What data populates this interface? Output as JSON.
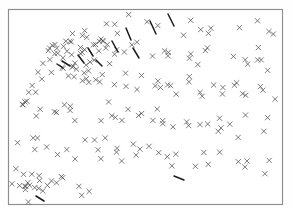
{
  "figure": {
    "title": "",
    "subtitle": "",
    "background_color": "#ffffff",
    "frame_color": "#8d8d8d",
    "marker_color": "#4a4a4a",
    "cluster_color": "#1a1a1a",
    "width_px": 293,
    "height_px": 219
  },
  "frame": {
    "x": 8,
    "y": 9,
    "width": 275,
    "height": 196
  },
  "chart_data": {
    "type": "scatter",
    "title": "",
    "subtitle": "",
    "xlabel": "",
    "ylabel": "",
    "xlim": [
      0,
      1
    ],
    "ylim": [
      0,
      1
    ],
    "grid": false,
    "legend": null,
    "marker": "x",
    "marker_size": 2.6,
    "point_count": 214,
    "annotations": [],
    "x": [
      0.447,
      0.52,
      0.545,
      0.572,
      0.6,
      0.625,
      0.658,
      0.694,
      0.72,
      0.76,
      0.795,
      0.833,
      0.865,
      0.9,
      0.935,
      0.963,
      0.985,
      0.413,
      0.383,
      0.352,
      0.32,
      0.287,
      0.26,
      0.236,
      0.213,
      0.19,
      0.167,
      0.146,
      0.128,
      0.112,
      0.098,
      0.086,
      0.074,
      0.063,
      0.054,
      0.046,
      0.04,
      0.034,
      0.2,
      0.222,
      0.245,
      0.266,
      0.288,
      0.307,
      0.33,
      0.354,
      0.372,
      0.395,
      0.42,
      0.442,
      0.466,
      0.489,
      0.513,
      0.536,
      0.56,
      0.583,
      0.607,
      0.63,
      0.654,
      0.677,
      0.7,
      0.724,
      0.748,
      0.771,
      0.795,
      0.818,
      0.842,
      0.866,
      0.889,
      0.913,
      0.936,
      0.96,
      0.982,
      0.15,
      0.17,
      0.192,
      0.214,
      0.236,
      0.258,
      0.28,
      0.302,
      0.324,
      0.346,
      0.368,
      0.39,
      0.412,
      0.434,
      0.456,
      0.478,
      0.5,
      0.522,
      0.544,
      0.566,
      0.588,
      0.61,
      0.632,
      0.654,
      0.676,
      0.698,
      0.72,
      0.742,
      0.764,
      0.786,
      0.808,
      0.83,
      0.852,
      0.874,
      0.896,
      0.918,
      0.94,
      0.962,
      0.984,
      0.03,
      0.052,
      0.074,
      0.096,
      0.118,
      0.14,
      0.162,
      0.184,
      0.206,
      0.228,
      0.25,
      0.272,
      0.294,
      0.316,
      0.338,
      0.36,
      0.382,
      0.404,
      0.426,
      0.448,
      0.47,
      0.492,
      0.514,
      0.536,
      0.558,
      0.58,
      0.602,
      0.624,
      0.646,
      0.668,
      0.69,
      0.712,
      0.734,
      0.756,
      0.778,
      0.8,
      0.822,
      0.844,
      0.866,
      0.888,
      0.91,
      0.932,
      0.954,
      0.976,
      0.022,
      0.044,
      0.066,
      0.088,
      0.11,
      0.132,
      0.154,
      0.176,
      0.198,
      0.22,
      0.242,
      0.264,
      0.286,
      0.308,
      0.33,
      0.352,
      0.374,
      0.396,
      0.418,
      0.44,
      0.462,
      0.484,
      0.506,
      0.528,
      0.55,
      0.572,
      0.594,
      0.616,
      0.638,
      0.66,
      0.682,
      0.704,
      0.726,
      0.748,
      0.77,
      0.792,
      0.814,
      0.836,
      0.858,
      0.88,
      0.902,
      0.924,
      0.946,
      0.968,
      0.99,
      0.015,
      0.037,
      0.059,
      0.081,
      0.103,
      0.125,
      0.147,
      0.169,
      0.191,
      0.213,
      0.235,
      0.257,
      0.279
    ],
    "y": [
      0.97,
      0.946,
      0.912,
      0.957,
      0.93,
      0.9,
      0.962,
      0.936,
      0.905,
      0.952,
      0.922,
      0.895,
      0.944,
      0.918,
      0.96,
      0.93,
      0.905,
      0.925,
      0.948,
      0.918,
      0.89,
      0.935,
      0.906,
      0.872,
      0.845,
      0.818,
      0.79,
      0.762,
      0.735,
      0.705,
      0.678,
      0.65,
      0.622,
      0.595,
      0.568,
      0.54,
      0.512,
      0.485,
      0.868,
      0.84,
      0.812,
      0.784,
      0.856,
      0.828,
      0.8,
      0.872,
      0.844,
      0.816,
      0.788,
      0.86,
      0.832,
      0.804,
      0.776,
      0.848,
      0.82,
      0.792,
      0.764,
      0.836,
      0.808,
      0.78,
      0.752,
      0.824,
      0.796,
      0.768,
      0.74,
      0.812,
      0.784,
      0.756,
      0.728,
      0.8,
      0.772,
      0.744,
      0.716,
      0.7,
      0.672,
      0.644,
      0.716,
      0.688,
      0.66,
      0.632,
      0.704,
      0.676,
      0.648,
      0.62,
      0.692,
      0.664,
      0.636,
      0.608,
      0.68,
      0.652,
      0.624,
      0.596,
      0.668,
      0.64,
      0.612,
      0.584,
      0.656,
      0.628,
      0.6,
      0.572,
      0.644,
      0.616,
      0.588,
      0.56,
      0.632,
      0.604,
      0.576,
      0.548,
      0.62,
      0.592,
      0.564,
      0.536,
      0.52,
      0.492,
      0.464,
      0.536,
      0.508,
      0.48,
      0.452,
      0.524,
      0.496,
      0.468,
      0.44,
      0.512,
      0.484,
      0.456,
      0.428,
      0.5,
      0.472,
      0.444,
      0.416,
      0.488,
      0.46,
      0.432,
      0.404,
      0.476,
      0.448,
      0.42,
      0.392,
      0.464,
      0.436,
      0.408,
      0.38,
      0.452,
      0.424,
      0.396,
      0.368,
      0.44,
      0.412,
      0.384,
      0.356,
      0.428,
      0.4,
      0.372,
      0.344,
      0.416,
      0.33,
      0.302,
      0.274,
      0.346,
      0.318,
      0.29,
      0.262,
      0.334,
      0.306,
      0.278,
      0.25,
      0.322,
      0.294,
      0.266,
      0.238,
      0.31,
      0.282,
      0.254,
      0.226,
      0.298,
      0.27,
      0.242,
      0.214,
      0.286,
      0.258,
      0.23,
      0.202,
      0.274,
      0.246,
      0.218,
      0.19,
      0.262,
      0.234,
      0.206,
      0.178,
      0.25,
      0.222,
      0.194,
      0.166,
      0.238,
      0.21,
      0.182,
      0.154,
      0.226,
      0.198,
      0.14,
      0.112,
      0.084,
      0.156,
      0.128,
      0.1,
      0.072,
      0.144,
      0.116,
      0.088,
      0.06,
      0.04,
      0.022
    ]
  }
}
